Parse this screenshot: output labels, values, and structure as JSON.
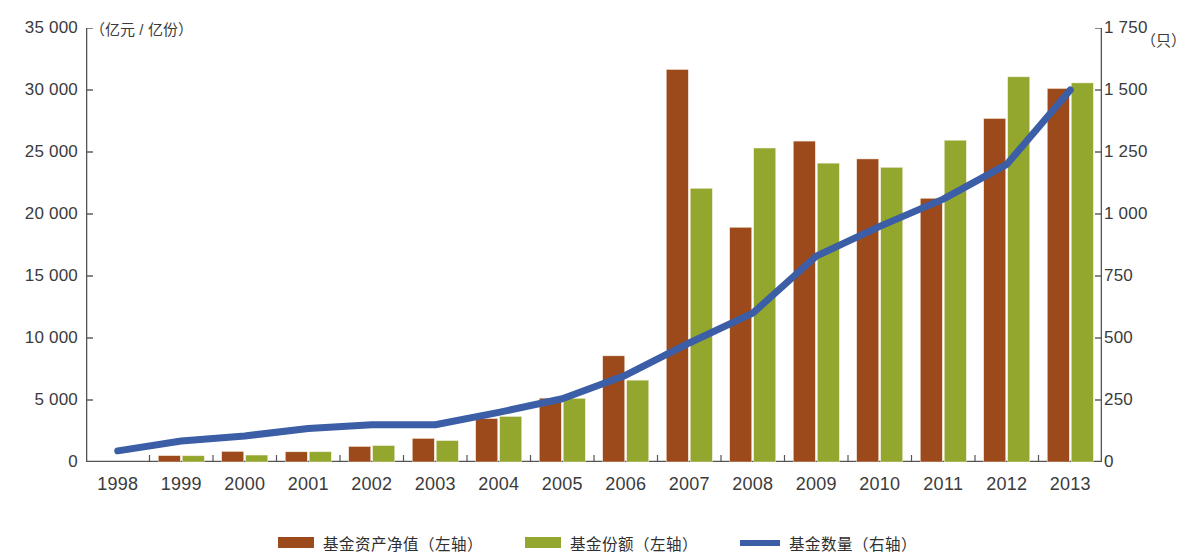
{
  "chart_data": {
    "type": "bar",
    "title": "",
    "subtitle": "",
    "xlabel": "",
    "categories": [
      "1998",
      "1999",
      "2000",
      "2001",
      "2002",
      "2003",
      "2004",
      "2005",
      "2006",
      "2007",
      "2008",
      "2009",
      "2010",
      "2011",
      "2012",
      "2013"
    ],
    "axes": {
      "left": {
        "label": "（亿元 / 亿份）",
        "unit_text": "（亿元 / 亿份）",
        "min": 0,
        "max": 35000,
        "step": 5000,
        "ticks": [
          0,
          5000,
          10000,
          15000,
          20000,
          25000,
          30000,
          35000
        ],
        "tick_labels": [
          "0",
          "5 000",
          "10 000",
          "15 000",
          "20 000",
          "25 000",
          "30 000",
          "35 000"
        ]
      },
      "right": {
        "label": "（只）",
        "unit_text": "（只）",
        "min": 0,
        "max": 1750,
        "step": 250,
        "ticks": [
          0,
          250,
          500,
          750,
          1000,
          1250,
          1500,
          1750
        ],
        "tick_labels": [
          "0",
          "250",
          "500",
          "750",
          "1 000",
          "1 250",
          "1 500",
          "1 750"
        ]
      }
    },
    "grid": false,
    "legend_position": "bottom",
    "series": [
      {
        "name": "基金资产净值（左轴）",
        "short_name": "基金资产净值",
        "axis": "left",
        "type": "bar",
        "color": "#9c4a1c",
        "values": [
          0,
          510,
          850,
          820,
          1250,
          1900,
          3500,
          5150,
          8560,
          31650,
          18930,
          25880,
          24440,
          21270,
          27700,
          30120
        ]
      },
      {
        "name": "基金份额（左轴）",
        "short_name": "基金份额",
        "axis": "left",
        "type": "bar",
        "color": "#93a62e",
        "values": [
          0,
          500,
          560,
          820,
          1320,
          1720,
          3670,
          5130,
          6600,
          22070,
          25320,
          24100,
          23760,
          25950,
          31060,
          30570
        ]
      },
      {
        "name": "基金数量（右轴）",
        "short_name": "基金数量",
        "axis": "right",
        "type": "line",
        "color": "#3b5ea6",
        "values": [
          45,
          85,
          105,
          135,
          150,
          150,
          200,
          255,
          350,
          480,
          600,
          830,
          950,
          1060,
          1200,
          1500
        ]
      }
    ]
  },
  "legend": {
    "items": [
      {
        "label": "基金资产净值（左轴）",
        "color": "#9c4a1c",
        "marker": "bar"
      },
      {
        "label": "基金份额（左轴）",
        "color": "#93a62e",
        "marker": "bar"
      },
      {
        "label": "基金数量（右轴）",
        "color": "#3b5ea6",
        "marker": "line"
      }
    ]
  },
  "colors": {
    "bar_net_asset": "#9c4a1c",
    "bar_shares": "#93a62e",
    "line_count": "#3b5ea6",
    "axis": "#555555",
    "text": "#3b3b3b"
  }
}
